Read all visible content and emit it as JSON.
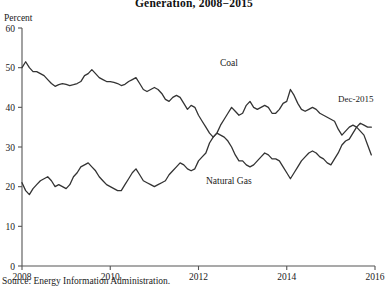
{
  "figure": {
    "title": "Generation, 2008−2015",
    "unit_label": "Percent",
    "source": "Source: Energy Information Administration.",
    "last_point_annotation": "Dec-2015",
    "coal_label": "Coal",
    "gas_label": "Natural Gas",
    "line_color": "#333333",
    "axis_color": "#555555"
  },
  "chart_data": {
    "type": "line",
    "title": "Generation, 2008−2015",
    "subtitle": "",
    "xlabel": "",
    "ylabel": "Percent",
    "xlim": [
      2008.0,
      2016.0
    ],
    "ylim": [
      0,
      60
    ],
    "yticks": [
      0,
      10,
      20,
      30,
      40,
      50,
      60
    ],
    "xticks": [
      2008,
      2010,
      2012,
      2014,
      2016
    ],
    "grid": false,
    "legend": "inline-annotations",
    "annotations": [
      {
        "text": "Coal",
        "x": 2012.1,
        "y": 45.5
      },
      {
        "text": "Natural Gas",
        "x": 2011.6,
        "y": 15.5
      },
      {
        "text": "Dec-2015",
        "x": 2015.55,
        "y": 39.5
      }
    ],
    "x": [
      2008.0,
      2008.083,
      2008.167,
      2008.25,
      2008.333,
      2008.417,
      2008.5,
      2008.583,
      2008.667,
      2008.75,
      2008.833,
      2008.917,
      2009.0,
      2009.083,
      2009.167,
      2009.25,
      2009.333,
      2009.417,
      2009.5,
      2009.583,
      2009.667,
      2009.75,
      2009.833,
      2009.917,
      2010.0,
      2010.083,
      2010.167,
      2010.25,
      2010.333,
      2010.417,
      2010.5,
      2010.583,
      2010.667,
      2010.75,
      2010.833,
      2010.917,
      2011.0,
      2011.083,
      2011.167,
      2011.25,
      2011.333,
      2011.417,
      2011.5,
      2011.583,
      2011.667,
      2011.75,
      2011.833,
      2011.917,
      2012.0,
      2012.083,
      2012.167,
      2012.25,
      2012.333,
      2012.417,
      2012.5,
      2012.583,
      2012.667,
      2012.75,
      2012.833,
      2012.917,
      2013.0,
      2013.083,
      2013.167,
      2013.25,
      2013.333,
      2013.417,
      2013.5,
      2013.583,
      2013.667,
      2013.75,
      2013.833,
      2013.917,
      2014.0,
      2014.083,
      2014.167,
      2014.25,
      2014.333,
      2014.417,
      2014.5,
      2014.583,
      2014.667,
      2014.75,
      2014.833,
      2014.917,
      2015.0,
      2015.083,
      2015.167,
      2015.25,
      2015.333,
      2015.417,
      2015.5,
      2015.583,
      2015.667,
      2015.75,
      2015.833,
      2015.917
    ],
    "series": [
      {
        "name": "Coal",
        "color": "#333333",
        "values": [
          50.0,
          51.5,
          50.0,
          49.0,
          49.0,
          48.5,
          48.0,
          47.0,
          46.0,
          45.3,
          45.7,
          46.0,
          45.8,
          45.5,
          45.7,
          46.0,
          46.5,
          48.0,
          48.5,
          49.5,
          48.5,
          47.5,
          47.0,
          46.5,
          46.5,
          46.3,
          46.0,
          45.5,
          45.8,
          46.5,
          47.0,
          47.5,
          46.0,
          44.5,
          44.0,
          44.5,
          45.0,
          44.5,
          43.5,
          42.0,
          41.5,
          42.5,
          43.0,
          42.5,
          41.0,
          39.5,
          40.5,
          40.0,
          38.0,
          36.5,
          35.0,
          33.5,
          32.5,
          33.5,
          35.5,
          37.0,
          38.5,
          40.0,
          39.0,
          38.0,
          38.5,
          40.5,
          41.5,
          40.0,
          39.5,
          40.0,
          40.5,
          40.0,
          38.5,
          38.5,
          39.5,
          41.0,
          41.5,
          44.5,
          43.0,
          41.0,
          39.5,
          39.0,
          39.5,
          40.0,
          39.5,
          38.5,
          38.0,
          37.5,
          37.0,
          36.5,
          34.5,
          33.0,
          34.0,
          35.0,
          35.5,
          35.0,
          34.0,
          33.0,
          30.5,
          28.0
        ]
      },
      {
        "name": "Natural Gas",
        "color": "#333333",
        "values": [
          21.0,
          19.0,
          18.0,
          19.5,
          20.5,
          21.5,
          22.0,
          22.5,
          21.5,
          20.0,
          20.5,
          20.0,
          19.5,
          20.5,
          22.5,
          23.5,
          25.0,
          25.5,
          26.0,
          25.0,
          24.0,
          22.5,
          21.5,
          20.5,
          20.0,
          19.5,
          19.0,
          19.0,
          20.5,
          22.0,
          23.5,
          24.5,
          23.0,
          21.5,
          21.0,
          20.5,
          20.0,
          20.5,
          21.0,
          21.5,
          23.0,
          24.0,
          25.0,
          26.0,
          25.5,
          24.5,
          24.0,
          24.5,
          26.5,
          27.5,
          28.5,
          31.0,
          32.5,
          33.5,
          33.0,
          32.5,
          31.5,
          30.0,
          28.0,
          26.5,
          26.5,
          25.5,
          25.0,
          25.5,
          26.5,
          27.5,
          28.5,
          28.0,
          27.0,
          27.0,
          26.5,
          25.0,
          23.5,
          22.0,
          23.5,
          25.0,
          26.5,
          27.5,
          28.5,
          29.0,
          28.5,
          27.5,
          27.0,
          26.0,
          25.5,
          27.0,
          28.5,
          30.5,
          31.5,
          32.0,
          33.5,
          35.0,
          36.0,
          35.5,
          35.0,
          35.0
        ]
      }
    ]
  }
}
